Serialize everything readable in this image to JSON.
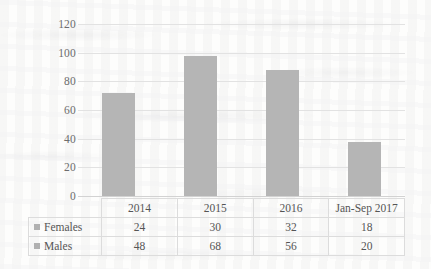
{
  "chart_data": {
    "type": "bar",
    "subtype": "stacked-column",
    "title": "",
    "xlabel": "",
    "ylabel": "",
    "categories": [
      "2014",
      "2015",
      "2016",
      "Jan-Sep 2017"
    ],
    "series": [
      {
        "name": "Females",
        "values": [
          24,
          30,
          32,
          18
        ],
        "color": "#b5b5b5"
      },
      {
        "name": "Males",
        "values": [
          48,
          68,
          56,
          20
        ],
        "color": "#b5b5b5"
      }
    ],
    "totals": [
      72,
      98,
      88,
      38
    ],
    "ylim": [
      0,
      120
    ],
    "yticks": [
      120,
      100,
      80,
      60,
      40,
      20,
      0
    ],
    "grid": true,
    "legend_position": "data-table-left",
    "data_table_visible": true
  },
  "table": {
    "header_row": [
      "2014",
      "2015",
      "2016",
      "Jan-Sep 2017"
    ],
    "rows": [
      {
        "label": "Females",
        "marker": "legend-swatch",
        "values": [
          "24",
          "30",
          "32",
          "18"
        ]
      },
      {
        "label": "Males",
        "marker": "legend-swatch",
        "values": [
          "48",
          "68",
          "56",
          "20"
        ]
      }
    ]
  },
  "axis": {
    "y_tick_labels": [
      "120",
      "100",
      "80",
      "60",
      "40",
      "20",
      "0"
    ]
  },
  "colors": {
    "bar": "#b5b5b5",
    "gridline": "#e2e2e2",
    "baseline": "#d2d2d2",
    "table_border": "#dcdcdc",
    "text": "#555555",
    "tick_text": "#6d6d6d",
    "background": "#fdfdfc"
  }
}
